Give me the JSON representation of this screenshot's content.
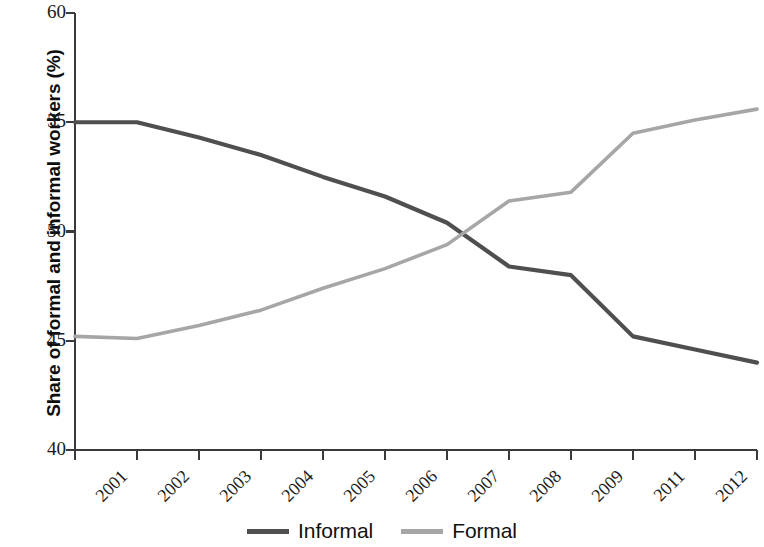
{
  "chart_data": {
    "type": "line",
    "title": "",
    "xlabel": "",
    "ylabel": "Share of formal and informal workers (%)",
    "x": [
      "2001",
      "2002",
      "2003",
      "2004",
      "2005",
      "2006",
      "2007",
      "2008",
      "2009",
      "2011",
      "2012",
      "2013"
    ],
    "categories": [
      "2001",
      "2002",
      "2003",
      "2004",
      "2005",
      "2006",
      "2007",
      "2008",
      "2009",
      "2011",
      "2012",
      "2013"
    ],
    "ylim": [
      40,
      60
    ],
    "yticks": [
      40,
      45,
      50,
      55,
      60
    ],
    "ytick_labels": [
      "40",
      "45",
      "50",
      "55",
      "60"
    ],
    "grid": false,
    "legend_position": "bottom-center",
    "series": [
      {
        "name": "Informal",
        "color": "#4f4f4f",
        "values": [
          55.0,
          55.0,
          54.3,
          53.5,
          52.5,
          51.6,
          50.4,
          48.4,
          48.0,
          45.2,
          44.6,
          44.0
        ]
      },
      {
        "name": "Formal",
        "color": "#a6a6a6",
        "values": [
          45.2,
          45.1,
          45.7,
          46.4,
          47.4,
          48.3,
          49.4,
          51.4,
          51.8,
          54.5,
          55.1,
          55.6
        ]
      }
    ],
    "annotations": []
  },
  "axis": {
    "color": "#3a3a3a"
  }
}
